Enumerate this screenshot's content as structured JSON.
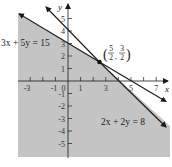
{
  "graph": {
    "axes": {
      "x_label": "x",
      "y_label": "y",
      "x_ticks": [
        "-3",
        "-1",
        "0",
        "1",
        "3",
        "5",
        "7"
      ],
      "y_ticks": [
        "5",
        "4",
        "3",
        "2",
        "1",
        "-1",
        "-2",
        "-3",
        "-4",
        "-5"
      ],
      "x_range": [
        -4,
        8
      ],
      "y_range": [
        -6,
        6
      ]
    },
    "lines": [
      {
        "equation": "3x + 5y = 15",
        "label": "3x + 5y = 15"
      },
      {
        "equation": "2x + 2y = 8",
        "label": "2x + 2y = 8"
      }
    ],
    "intersection": {
      "label_x_num": "5",
      "label_x_den": "2",
      "label_y_num": "3",
      "label_y_den": "2",
      "point": [
        2.5,
        1.5
      ]
    },
    "shaded_region": "3x + 5y ≤ 15 and 2x + 2y ≤ 8",
    "colors": {
      "shade": "#c4c4c4",
      "line": "#1a1a1a",
      "background": "#ffffff"
    }
  }
}
